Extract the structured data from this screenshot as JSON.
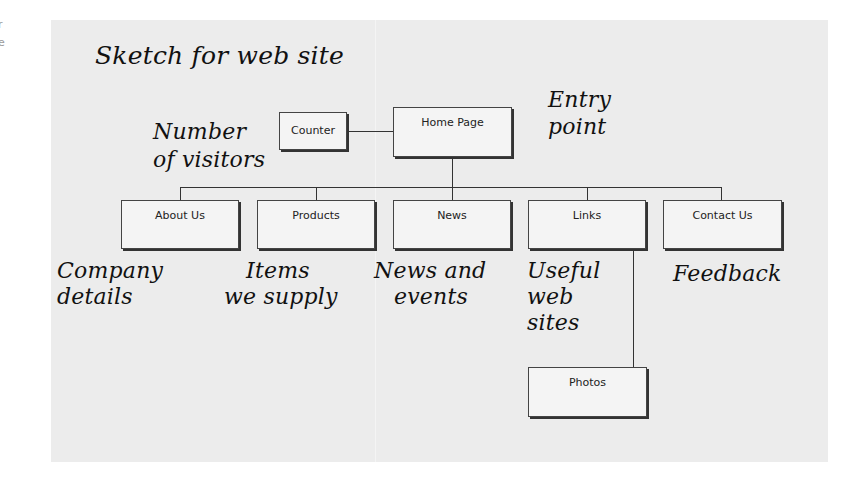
{
  "edge_fragments": [
    "r",
    "e"
  ],
  "diagram": {
    "title": "Sketch for web site",
    "nodes": {
      "home": {
        "label": "Home Page",
        "note": [
          "Entry",
          "point"
        ]
      },
      "counter": {
        "label": "Counter",
        "note": [
          "Number",
          "of visitors"
        ]
      },
      "about": {
        "label": "About Us",
        "note": [
          "Company",
          "details"
        ]
      },
      "products": {
        "label": "Products",
        "note": [
          "Items",
          "we supply"
        ]
      },
      "news": {
        "label": "News",
        "note": [
          "News and",
          "events"
        ]
      },
      "links": {
        "label": "Links",
        "note": [
          "Useful",
          "web",
          "sites"
        ]
      },
      "contact": {
        "label": "Contact Us",
        "note": [
          "Feedback"
        ]
      },
      "photos": {
        "label": "Photos"
      }
    },
    "edges": [
      [
        "counter",
        "home"
      ],
      [
        "home",
        "about"
      ],
      [
        "home",
        "products"
      ],
      [
        "home",
        "news"
      ],
      [
        "home",
        "links"
      ],
      [
        "home",
        "contact"
      ],
      [
        "links",
        "photos"
      ]
    ],
    "colors": {
      "background": "#ececec",
      "box_fill": "#f4f4f4",
      "ink": "#111111",
      "line": "#333333"
    }
  }
}
